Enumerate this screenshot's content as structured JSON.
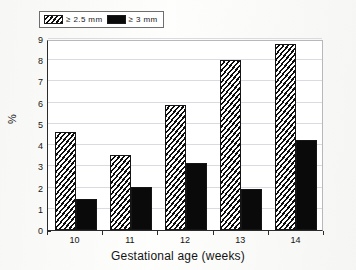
{
  "chart_data": {
    "type": "bar",
    "title": "",
    "subtitle": "",
    "xlabel": "Gestational age (weeks)",
    "ylabel": "%",
    "categories": [
      "10",
      "11",
      "12",
      "13",
      "14"
    ],
    "series": [
      {
        "name": "≥ 2.5 mm",
        "values": [
          4.6,
          3.55,
          5.9,
          8.0,
          8.75
        ],
        "fill": "diagonal-hatch",
        "color": "#0d0d0d"
      },
      {
        "name": "≥ 3 mm",
        "values": [
          1.45,
          2.05,
          3.15,
          1.95,
          4.25
        ],
        "fill": "solid",
        "color": "#0a0a0a"
      }
    ],
    "ylim": [
      0,
      9
    ],
    "yticks": [
      0,
      1,
      2,
      3,
      4,
      5,
      6,
      7,
      8,
      9
    ],
    "ytick_labels": [
      "0",
      "1",
      "2",
      "3",
      "4",
      "5",
      "6",
      "7",
      "8",
      "9"
    ],
    "grid": true,
    "grid_axis": "y",
    "legend_position": "top-left",
    "legend_border_color": "#6e6e6e",
    "axis_color": "#2b2b2b",
    "gridline_color": "#ddd9e0",
    "background": "#ffffff"
  },
  "legend": {
    "entries": [
      {
        "label": "≥ 2.5 mm",
        "swatch": "hatched-swatch"
      },
      {
        "label": "≥ 3 mm",
        "swatch": "solid-swatch"
      }
    ]
  }
}
